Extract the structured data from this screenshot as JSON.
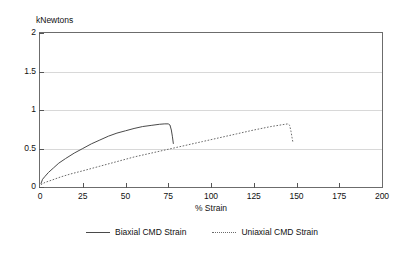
{
  "title": "",
  "y_unit_label": "kNewtons",
  "x_axis_title": "% Strain",
  "axes": {
    "y_ticks": [
      "0",
      "0.5",
      "1",
      "1.5",
      "2"
    ],
    "x_ticks": [
      "0",
      "25",
      "50",
      "75",
      "100",
      "125",
      "150",
      "175",
      "200"
    ]
  },
  "legend": {
    "items": [
      {
        "label": "Biaxial CMD Strain",
        "style": "solid",
        "color": "#4a4a4a"
      },
      {
        "label": "Uniaxial CMD Strain",
        "style": "dotted",
        "color": "#6a6a6a"
      }
    ]
  },
  "chart_data": {
    "type": "line",
    "title": "",
    "xlabel": "% Strain",
    "ylabel": "kNewtons",
    "xlim": [
      0,
      200
    ],
    "ylim": [
      0,
      2
    ],
    "xticks": [
      0,
      25,
      50,
      75,
      100,
      125,
      150,
      175,
      200
    ],
    "yticks": [
      0,
      0.5,
      1,
      1.5,
      2
    ],
    "grid": "horizontal-light",
    "legend_position": "bottom-center",
    "series": [
      {
        "name": "Biaxial CMD Strain",
        "style": "solid",
        "color": "#4a4a4a",
        "points": [
          [
            0.5,
            0.04
          ],
          [
            1.5,
            0.1
          ],
          [
            3,
            0.14
          ],
          [
            5,
            0.19
          ],
          [
            8,
            0.25
          ],
          [
            11,
            0.31
          ],
          [
            15,
            0.37
          ],
          [
            20,
            0.44
          ],
          [
            25,
            0.5
          ],
          [
            30,
            0.56
          ],
          [
            35,
            0.61
          ],
          [
            40,
            0.66
          ],
          [
            45,
            0.7
          ],
          [
            50,
            0.73
          ],
          [
            55,
            0.76
          ],
          [
            60,
            0.785
          ],
          [
            65,
            0.8
          ],
          [
            70,
            0.815
          ],
          [
            73,
            0.82
          ],
          [
            75,
            0.82
          ],
          [
            76,
            0.805
          ],
          [
            76.8,
            0.74
          ],
          [
            77.4,
            0.66
          ],
          [
            78,
            0.56
          ]
        ]
      },
      {
        "name": "Uniaxial CMD Strain",
        "style": "dotted",
        "color": "#6a6a6a",
        "points": [
          [
            0.5,
            0.03
          ],
          [
            3,
            0.06
          ],
          [
            7,
            0.09
          ],
          [
            12,
            0.13
          ],
          [
            18,
            0.17
          ],
          [
            25,
            0.21
          ],
          [
            35,
            0.27
          ],
          [
            45,
            0.33
          ],
          [
            55,
            0.39
          ],
          [
            65,
            0.44
          ],
          [
            75,
            0.49
          ],
          [
            85,
            0.54
          ],
          [
            95,
            0.59
          ],
          [
            105,
            0.64
          ],
          [
            115,
            0.69
          ],
          [
            125,
            0.74
          ],
          [
            135,
            0.785
          ],
          [
            142,
            0.81
          ],
          [
            145,
            0.82
          ],
          [
            146,
            0.8
          ],
          [
            146.8,
            0.72
          ],
          [
            147.4,
            0.64
          ],
          [
            148,
            0.57
          ]
        ]
      }
    ]
  }
}
